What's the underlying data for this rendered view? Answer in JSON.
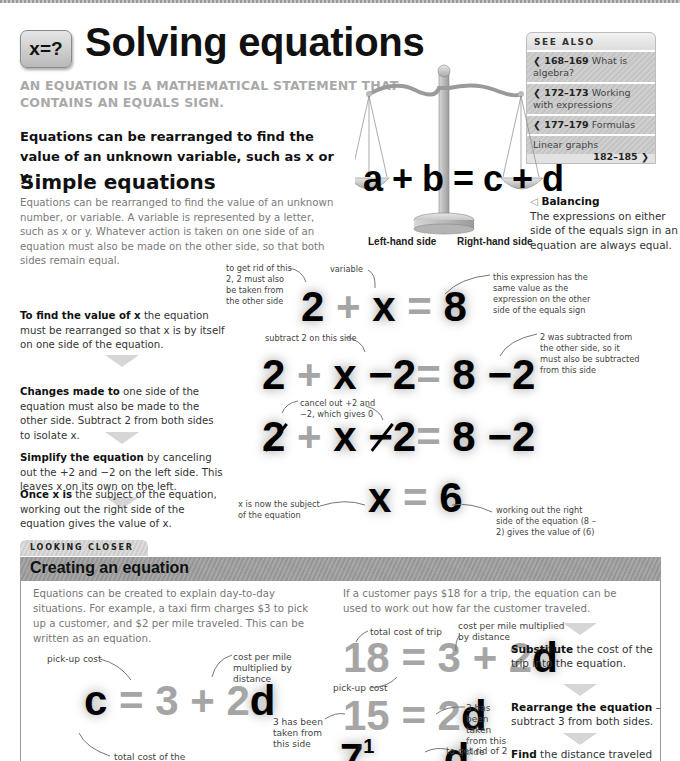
{
  "header": {
    "badge": "x=?",
    "title": "Solving equations",
    "subtitle": "AN EQUATION IS A MATHEMATICAL STATEMENT THAT CONTAINS AN EQUALS SIGN.",
    "lead": "Equations can be rearranged to find the value of an unknown variable, such as x or y."
  },
  "see_also": {
    "heading": "SEE ALSO",
    "items": [
      {
        "pages": "168–169",
        "label": "What is algebra?",
        "direction": "back"
      },
      {
        "pages": "172–173",
        "label": "Working with expressions",
        "direction": "back"
      },
      {
        "pages": "177–179",
        "label": "Formulas",
        "direction": "back"
      },
      {
        "pages": "182–185",
        "label": "Linear graphs",
        "direction": "forward"
      }
    ]
  },
  "scales": {
    "equation": "a + b = c + d",
    "left_label": "Left-hand side",
    "right_label": "Right-hand side",
    "caption_title": "Balancing",
    "caption_text": "The expressions on either side of the equals sign in an equation are always equal."
  },
  "simple": {
    "heading": "Simple equations",
    "intro": "Equations can be rearranged to find the value of an unknown number, or variable. A variable is represented by a letter, such as x or y. Whatever action is taken on one side of an equation must also be made on the other side, so that both sides remain equal.",
    "steps": [
      {
        "bold": "To find the value of x",
        "text": " the equation must be rearranged so that x is by itself on one side of the equation."
      },
      {
        "bold": "Changes made to",
        "text": " one side of the equation must also be made to the other side. Subtract 2 from both sides to isolate x."
      },
      {
        "bold": "Simplify the equation",
        "text": " by canceling out the +2 and −2 on the left side. This leaves x on its own on the left."
      },
      {
        "bold": "Once x is",
        "text": " the subject of the equation, working out the right side of the equation gives the value of x."
      }
    ],
    "equations": {
      "eq1": [
        "2",
        "+",
        "x",
        "=",
        "8"
      ],
      "eq2": [
        "2",
        "+",
        "x",
        "−2",
        "=",
        "8",
        "−2"
      ],
      "eq3": [
        "2",
        "+",
        "x",
        "−2",
        "=",
        "8",
        "−2"
      ],
      "eq4": [
        "x",
        "=",
        "6"
      ]
    },
    "notes": {
      "get_rid": "to get rid of this 2, 2 must also be taken from the other side",
      "variable": "variable",
      "same_value": "this expression has the same value as the expression on the other side of the equals sign",
      "subtract_this": "subtract 2 on this side",
      "was_subtracted": "2 was subtracted from the other side, so it must also be subtracted from this side",
      "cancel": "cancel out +2 and −2, which gives 0",
      "subject": "x is now the subject of the equation",
      "working_out": "working out the right side of the equation (8 – 2) gives the value of (6)"
    }
  },
  "looking_closer": {
    "tab": "LOOKING CLOSER",
    "title": "Creating an equation",
    "left_text": "Equations can be created to explain day-to-day situations. For example, a taxi firm charges $3 to pick up a customer, and $2 per mile traveled. This can be written as an equation.",
    "right_text": "If a customer pays $18 for a trip, the equation can be used to work out how far the customer traveled.",
    "base_eq": [
      "c",
      "=",
      "3",
      "+",
      "2",
      "d"
    ],
    "sub_eq": [
      "18",
      "=",
      "3",
      "+",
      "2",
      "d"
    ],
    "rearr_eq": [
      "15",
      "=",
      "2",
      "d"
    ],
    "find_eq": [
      "7",
      "1",
      "d"
    ],
    "notes": {
      "pickup": "pick-up cost",
      "cost_per_mile": "cost per mile multiplied by distance",
      "total_cost": "total cost of the",
      "total_trip": "total cost of trip",
      "cost_per_mile_2": "cost per mile multiplied by distance",
      "pickup_2": "pick-up cost",
      "three_taken_left": "3 has been taken from this side",
      "three_taken_right": "3 has been taken from this side",
      "get_rid_2": "to get rid of 2"
    },
    "side_steps": [
      {
        "bold": "Substitute",
        "text": " the cost of the trip into the equation."
      },
      {
        "bold": "Rearrange the equation",
        "text": " – subtract 3 from both sides."
      },
      {
        "bold": "Find",
        "text": " the distance traveled"
      }
    ]
  }
}
